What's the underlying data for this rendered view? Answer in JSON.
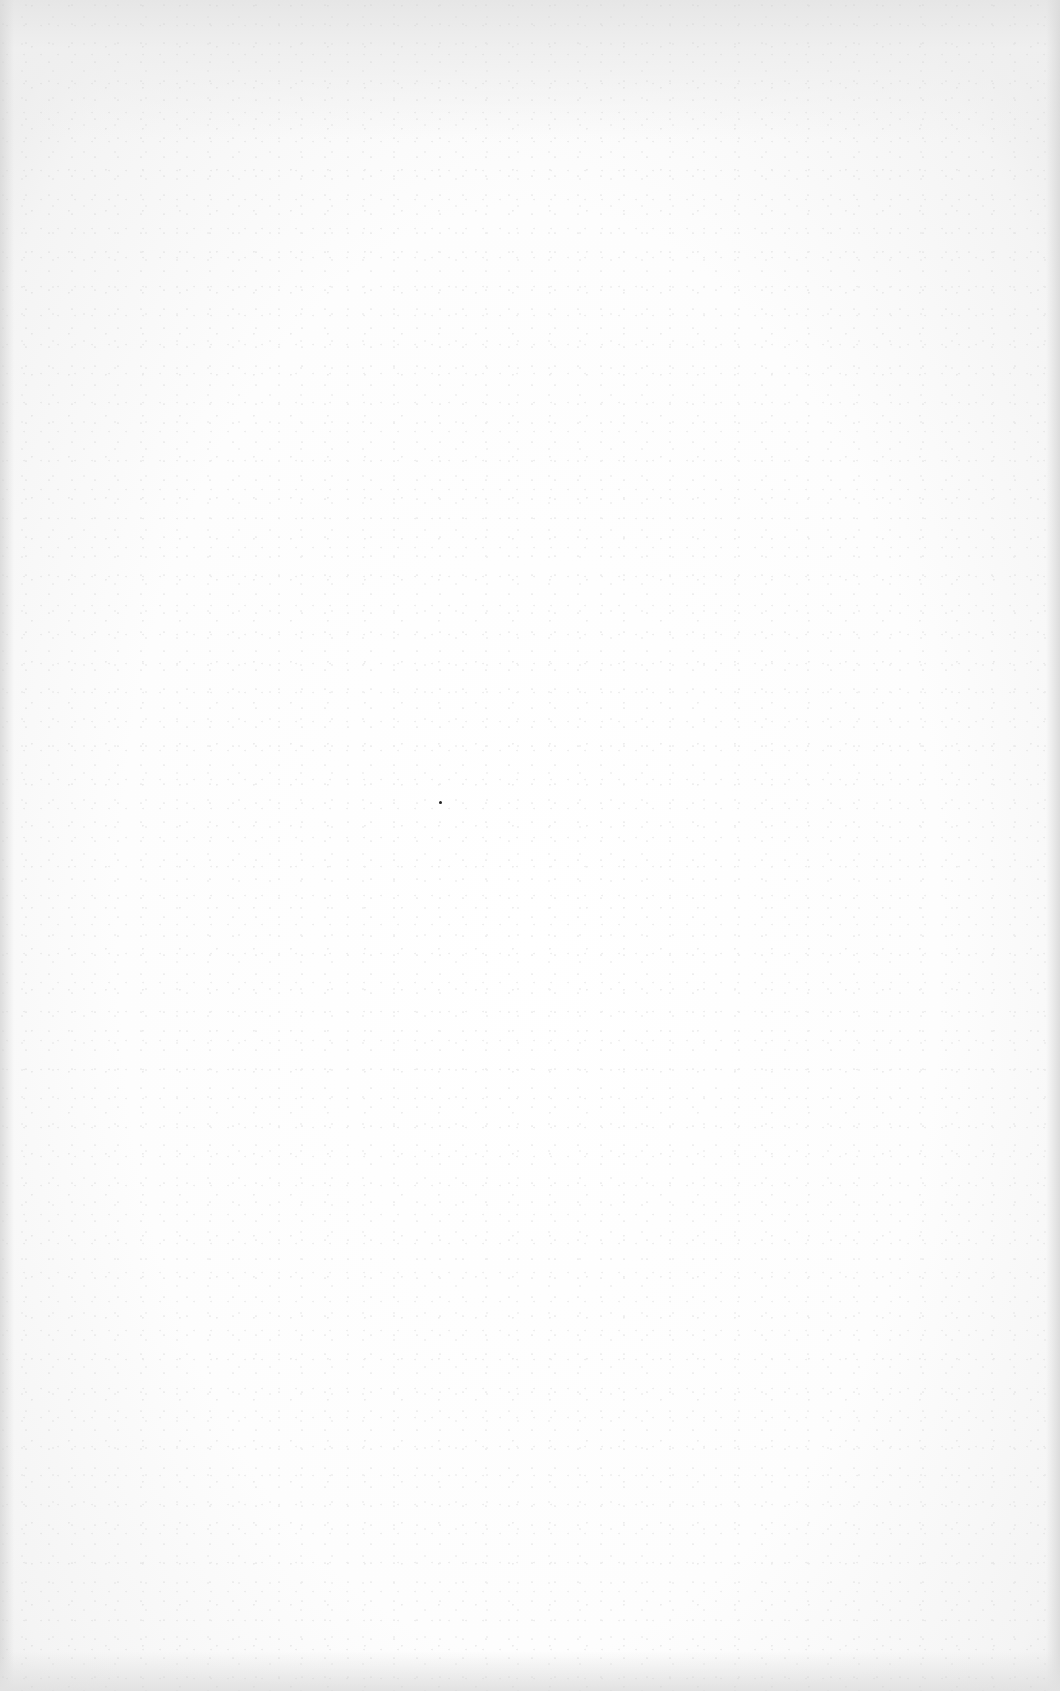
{
  "document": {
    "type": "blank-scanned-page",
    "text": "",
    "background_color": "#ffffff",
    "border_tint": "#e2e2e2"
  },
  "artifacts": [
    {
      "kind": "speck",
      "x": 440,
      "y": 802,
      "color": "#222222"
    }
  ]
}
